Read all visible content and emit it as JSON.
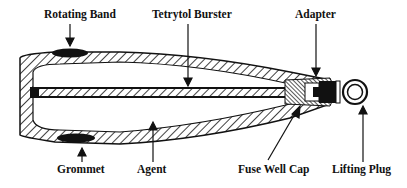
{
  "diagram": {
    "type": "cross-section",
    "labels": {
      "rotating_band": "Rotating Band",
      "tetrytol_burster": "Tetrytol Burster",
      "adapter": "Adapter",
      "grommet": "Grommet",
      "agent": "Agent",
      "fuse_well_cap": "Fuse Well Cap",
      "lifting_plug": "Lifting Plug"
    },
    "colors": {
      "ink": "#111111",
      "background": "#ffffff"
    }
  }
}
